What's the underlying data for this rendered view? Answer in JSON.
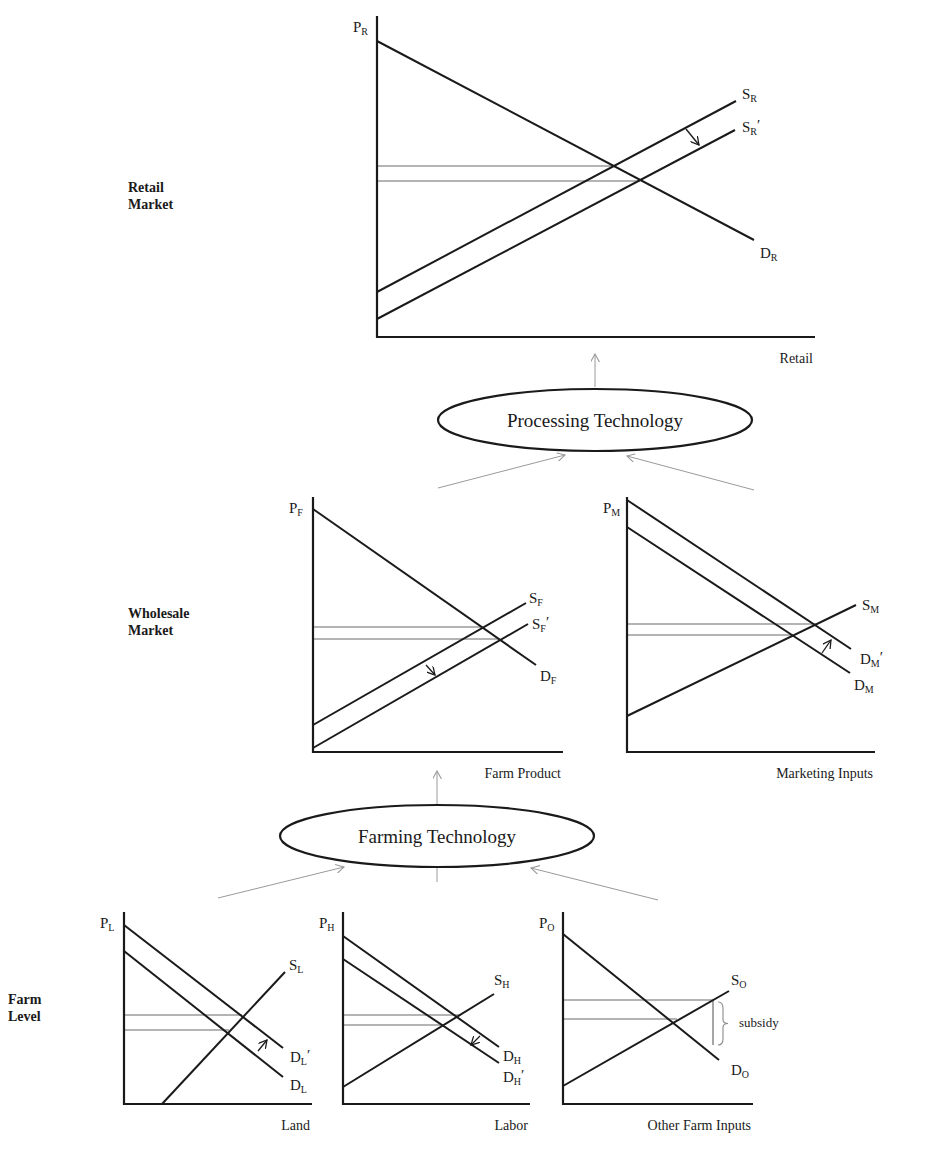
{
  "levels": [
    {
      "id": "retail",
      "line1": "Retail",
      "line2": "Market",
      "x": 128,
      "y": 192
    },
    {
      "id": "wholesale",
      "line1": "Wholesale",
      "line2": "Market",
      "x": 128,
      "y": 618
    },
    {
      "id": "farm",
      "line1": "Farm",
      "line2": "Level",
      "x": 8,
      "y": 1004
    }
  ],
  "technologies": [
    {
      "id": "processing",
      "label": "Processing Technology",
      "cx": 595,
      "cy": 420,
      "rx": 157,
      "ry": 31
    },
    {
      "id": "farming",
      "label": "Farming Technology",
      "cx": 437,
      "cy": 836,
      "rx": 157,
      "ry": 31
    }
  ],
  "flows": [
    {
      "from": [
        595,
        387
      ],
      "to": [
        595,
        354
      ]
    },
    {
      "from": [
        438,
        488
      ],
      "to": [
        565,
        455
      ]
    },
    {
      "from": [
        754,
        490
      ],
      "to": [
        627,
        456
      ]
    },
    {
      "from": [
        437,
        805
      ],
      "to": [
        437,
        771
      ]
    },
    {
      "from": [
        218,
        898
      ],
      "to": [
        344,
        867
      ]
    },
    {
      "from": [
        437,
        882
      ],
      "to": [
        437,
        850
      ]
    },
    {
      "from": [
        658,
        900
      ],
      "to": [
        531,
        868
      ]
    }
  ],
  "chart_data": [
    {
      "id": "retail",
      "type": "line",
      "title": "Retail Market",
      "ylabel": {
        "main": "P",
        "sub": "R"
      },
      "xlabel": "Retail",
      "origin": [
        377,
        337
      ],
      "y_top": 16,
      "x_end": 815,
      "series": [
        {
          "name": "D_R",
          "main": "D",
          "sub": "R",
          "prime": "",
          "points": [
            [
              377,
              41
            ],
            [
              754,
              240
            ]
          ],
          "label_at": [
            760,
            258
          ]
        },
        {
          "name": "S_R",
          "main": "S",
          "sub": "R",
          "prime": "",
          "points": [
            [
              377,
              292
            ],
            [
              736,
              101
            ]
          ],
          "label_at": [
            742,
            99
          ]
        },
        {
          "name": "S_R'",
          "main": "S",
          "sub": "R",
          "prime": "′",
          "points": [
            [
              377,
              319
            ],
            [
              735,
              130
            ]
          ],
          "label_at": [
            742,
            132
          ]
        }
      ],
      "price_lines": [
        {
          "y": 166,
          "x_end": 613
        },
        {
          "y": 181,
          "x_end": 640
        }
      ],
      "shift_arrows": [
        {
          "from": [
            686,
            129
          ],
          "to": [
            699,
            145
          ]
        }
      ],
      "annotations": []
    },
    {
      "id": "farm_product",
      "type": "line",
      "title": "Wholesale Market - Farm Product",
      "ylabel": {
        "main": "P",
        "sub": "F"
      },
      "xlabel": "Farm Product",
      "origin": [
        313,
        752
      ],
      "y_top": 497,
      "x_end": 563,
      "series": [
        {
          "name": "D_F",
          "main": "D",
          "sub": "F",
          "prime": "",
          "points": [
            [
              313,
              509
            ],
            [
              536,
              665
            ]
          ],
          "label_at": [
            540,
            681
          ]
        },
        {
          "name": "S_F",
          "main": "S",
          "sub": "F",
          "prime": "",
          "points": [
            [
              313,
              725
            ],
            [
              526,
              603
            ]
          ],
          "label_at": [
            529,
            603
          ]
        },
        {
          "name": "S_F'",
          "main": "S",
          "sub": "F",
          "prime": "′",
          "points": [
            [
              313,
              748
            ],
            [
              528,
              624
            ]
          ],
          "label_at": [
            532,
            629
          ]
        }
      ],
      "price_lines": [
        {
          "y": 627,
          "x_end": 482
        },
        {
          "y": 639,
          "x_end": 499
        }
      ],
      "shift_arrows": [
        {
          "from": [
            426,
            665
          ],
          "to": [
            435,
            675
          ]
        }
      ],
      "annotations": []
    },
    {
      "id": "marketing_inputs",
      "type": "line",
      "title": "Wholesale Market - Marketing Inputs",
      "ylabel": {
        "main": "P",
        "sub": "M"
      },
      "xlabel": "Marketing Inputs",
      "origin": [
        627,
        752
      ],
      "y_top": 497,
      "x_end": 875,
      "series": [
        {
          "name": "D_M",
          "main": "D",
          "sub": "M",
          "prime": "",
          "points": [
            [
              627,
              527
            ],
            [
              850,
              673
            ]
          ],
          "label_at": [
            854,
            690
          ]
        },
        {
          "name": "D_M'",
          "main": "D",
          "sub": "M",
          "prime": "′",
          "points": [
            [
              627,
              500
            ],
            [
              851,
              649
            ]
          ],
          "label_at": [
            860,
            664
          ]
        },
        {
          "name": "S_M",
          "main": "S",
          "sub": "M",
          "prime": "",
          "points": [
            [
              627,
              716
            ],
            [
              856,
              605
            ]
          ],
          "label_at": [
            862,
            610
          ]
        }
      ],
      "price_lines": [
        {
          "y": 624,
          "x_end": 816
        },
        {
          "y": 635,
          "x_end": 793
        }
      ],
      "shift_arrows": [
        {
          "from": [
            822,
            653
          ],
          "to": [
            831,
            640
          ]
        }
      ],
      "annotations": []
    },
    {
      "id": "land",
      "type": "line",
      "title": "Farm Level - Land",
      "ylabel": {
        "main": "P",
        "sub": "L"
      },
      "xlabel": "Land",
      "origin": [
        124,
        1104
      ],
      "y_top": 912,
      "x_end": 312,
      "series": [
        {
          "name": "D_L",
          "main": "D",
          "sub": "L",
          "prime": "",
          "points": [
            [
              124,
              951
            ],
            [
              283,
              1077
            ]
          ],
          "label_at": [
            290,
            1090
          ]
        },
        {
          "name": "D_L'",
          "main": "D",
          "sub": "L",
          "prime": "′",
          "points": [
            [
              124,
              925
            ],
            [
              283,
              1048
            ]
          ],
          "label_at": [
            290,
            1062
          ]
        },
        {
          "name": "S_L",
          "main": "S",
          "sub": "L",
          "prime": "",
          "points": [
            [
              162,
              1104
            ],
            [
              285,
              972
            ]
          ],
          "label_at": [
            289,
            970
          ]
        }
      ],
      "price_lines": [
        {
          "y": 1015,
          "x_end": 242
        },
        {
          "y": 1030,
          "x_end": 229
        }
      ],
      "shift_arrows": [
        {
          "from": [
            258,
            1051
          ],
          "to": [
            267,
            1040
          ]
        }
      ],
      "annotations": []
    },
    {
      "id": "labor",
      "type": "line",
      "title": "Farm Level - Labor",
      "ylabel": {
        "main": "P",
        "sub": "H"
      },
      "xlabel": "Labor",
      "origin": [
        343,
        1104
      ],
      "y_top": 912,
      "x_end": 530,
      "series": [
        {
          "name": "D_H",
          "main": "D",
          "sub": "H",
          "prime": "",
          "points": [
            [
              343,
              936
            ],
            [
              499,
              1047
            ]
          ],
          "label_at": [
            503,
            1061
          ]
        },
        {
          "name": "D_H'",
          "main": "D",
          "sub": "H",
          "prime": "′",
          "points": [
            [
              343,
              959
            ],
            [
              499,
              1063
            ]
          ],
          "label_at": [
            503,
            1082
          ]
        },
        {
          "name": "S_H",
          "main": "S",
          "sub": "H",
          "prime": "",
          "points": [
            [
              343,
              1087
            ],
            [
              494,
              994
            ]
          ],
          "label_at": [
            494,
            985
          ]
        }
      ],
      "price_lines": [
        {
          "y": 1015,
          "x_end": 461
        },
        {
          "y": 1025,
          "x_end": 443
        }
      ],
      "shift_arrows": [
        {
          "from": [
            480,
            1036
          ],
          "to": [
            471,
            1045
          ]
        }
      ],
      "annotations": []
    },
    {
      "id": "other_farm_inputs",
      "type": "line",
      "title": "Farm Level - Other Farm Inputs",
      "ylabel": {
        "main": "P",
        "sub": "O"
      },
      "xlabel": "Other Farm Inputs",
      "origin": [
        563,
        1104
      ],
      "y_top": 912,
      "x_end": 753,
      "series": [
        {
          "name": "D_O",
          "main": "D",
          "sub": "O",
          "prime": "",
          "points": [
            [
              563,
              934
            ],
            [
              719,
              1060
            ]
          ],
          "label_at": [
            731,
            1075
          ]
        },
        {
          "name": "S_O",
          "main": "S",
          "sub": "O",
          "prime": "",
          "points": [
            [
              563,
              1086
            ],
            [
              729,
              991
            ]
          ],
          "label_at": [
            731,
            985
          ]
        }
      ],
      "price_lines": [
        {
          "y": 1000,
          "x_end": 713
        },
        {
          "y": 1019,
          "x_end": 677
        }
      ],
      "shift_arrows": [],
      "annotations": [
        {
          "type": "vline",
          "x": 713,
          "y1": 1000,
          "y2": 1045
        },
        {
          "type": "brace",
          "x": 718,
          "y1": 1002,
          "y2": 1045,
          "label": "subsidy",
          "label_at": [
            739,
            1027
          ]
        }
      ]
    }
  ]
}
